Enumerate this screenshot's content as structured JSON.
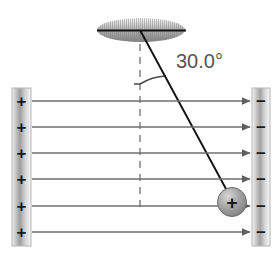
{
  "figure": {
    "angle_label": "30.0°",
    "ceiling": {
      "name": "ceiling-support",
      "hatch_color": "#8a8a8a",
      "line_color": "#1a1a1a"
    },
    "string": {
      "name": "string",
      "color": "#1a1a1a",
      "angle_from_vertical_deg": 30.0
    },
    "vertical_reference": {
      "name": "vertical-dashed-line",
      "color": "#8c8c8c",
      "style": "dashed"
    },
    "ball": {
      "name": "charged-ball",
      "charge_sign": "+",
      "fill_color": "#9a9a9a",
      "edge_color": "#6b6b6b"
    },
    "left_plate": {
      "name": "left-plate",
      "charge_sign": "+",
      "charge_count": 6,
      "charges": [
        "+",
        "+",
        "+",
        "+",
        "+",
        "+"
      ],
      "fill_light": "#f2f2f2",
      "fill_dark": "#9d9d9d",
      "border_color": "#b0b0b0"
    },
    "right_plate": {
      "name": "right-plate",
      "charge_sign": "−",
      "charge_count": 6,
      "charges": [
        "−",
        "−",
        "−",
        "−",
        "−",
        "−"
      ],
      "fill_light": "#f4f4f4",
      "fill_dark": "#a2a2a2",
      "border_color": "#b0b0b0"
    },
    "field_lines": {
      "name": "electric-field-lines",
      "count": 6,
      "direction": "left-to-right",
      "color": "#6e6e6e",
      "y_positions": [
        101,
        127,
        153,
        179,
        206,
        232
      ]
    }
  }
}
